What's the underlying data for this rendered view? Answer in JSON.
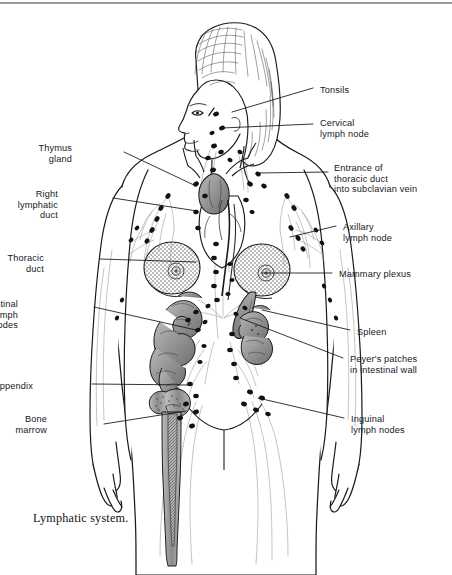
{
  "page": {
    "caption": "Lymphatic system.",
    "top_rule_color": "#9a9a9a",
    "background": "#ffffff",
    "ink_color": "#16181c"
  },
  "figure": {
    "style": "line-drawing-with-grey-shaded-organs",
    "organ_shade_color": "#8d8d8d",
    "node_color": "#111111",
    "vessel_color": "#6e6e6e"
  },
  "labels": {
    "left": [
      {
        "id": "thymus-gland",
        "text": "Thymus\ngland",
        "x": 72,
        "y": 143,
        "align": "right"
      },
      {
        "id": "right-lymphatic-duct",
        "text": "Right\nlymphatic\nduct",
        "x": 58,
        "y": 189,
        "align": "right"
      },
      {
        "id": "thoracic-duct",
        "text": "Thoracic\nduct",
        "x": 44,
        "y": 253,
        "align": "right"
      },
      {
        "id": "intestinal-lymph-nodes",
        "text": "Intestinal\nlymph nodes",
        "x": 18,
        "y": 299,
        "align": "right"
      },
      {
        "id": "appendix",
        "text": "Appendix",
        "x": 33,
        "y": 381,
        "align": "right"
      },
      {
        "id": "bone-marrow",
        "text": "Bone\nmarrow",
        "x": 47,
        "y": 414,
        "align": "right"
      }
    ],
    "right": [
      {
        "id": "tonsils",
        "text": "Tonsils",
        "x": 320,
        "y": 85,
        "align": "left"
      },
      {
        "id": "cervical-lymph-node",
        "text": "Cervical\nlymph node",
        "x": 320,
        "y": 118,
        "align": "left"
      },
      {
        "id": "entrance-thoracic-duct",
        "text": "Entrance of\nthoracic duct\ninto subclavian vein",
        "x": 334,
        "y": 163,
        "align": "left"
      },
      {
        "id": "axillary-lymph-node",
        "text": "Axillary\nlymph node",
        "x": 343,
        "y": 222,
        "align": "left"
      },
      {
        "id": "mammary-plexus",
        "text": "Mammary plexus",
        "x": 339,
        "y": 269,
        "align": "left"
      },
      {
        "id": "spleen",
        "text": "Spleen",
        "x": 357,
        "y": 327,
        "align": "left"
      },
      {
        "id": "peyers-patches",
        "text": "Peyer's patches\nin intestinal wall",
        "x": 350,
        "y": 354,
        "align": "left"
      },
      {
        "id": "inguinal-lymph-nodes",
        "text": "Inguinal\nlymph nodes",
        "x": 351,
        "y": 414,
        "align": "left"
      }
    ]
  },
  "leader_lines": [
    {
      "id": "leader-tonsils",
      "points": "313,88 232,112"
    },
    {
      "id": "leader-cervical",
      "points": "313,124 222,128"
    },
    {
      "id": "leader-entrance-thoracic",
      "points": "328,172 258,173"
    },
    {
      "id": "leader-axillary",
      "points": "336,226 290,237"
    },
    {
      "id": "leader-mammary",
      "points": "332,273 262,273"
    },
    {
      "id": "leader-spleen",
      "points": "350,330 262,310"
    },
    {
      "id": "leader-peyers",
      "points": "343,358 240,318"
    },
    {
      "id": "leader-inguinal",
      "points": "344,418 258,398"
    },
    {
      "id": "leader-thymus",
      "points": "124,152 196,186"
    },
    {
      "id": "leader-right-lymphatic-duct",
      "points": "113,198 197,211"
    },
    {
      "id": "leader-thoracic-duct",
      "points": "100,259 196,262"
    },
    {
      "id": "leader-intestinal",
      "points": "94,307 196,330"
    },
    {
      "id": "leader-appendix",
      "points": "92,384 190,385"
    },
    {
      "id": "leader-bone-marrow",
      "points": "104,424 186,411"
    }
  ]
}
